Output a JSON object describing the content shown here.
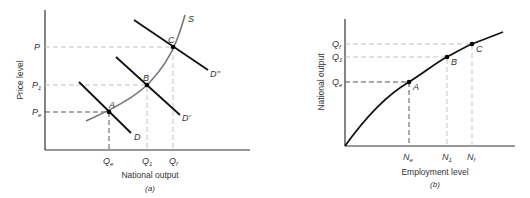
{
  "panel_a": {
    "caption": "(a)",
    "x_axis_label": "National output",
    "y_axis_label": "Price level",
    "curves": {
      "supply": "S",
      "demand": "D",
      "demand_prime": "D'",
      "demand_double_prime": "D''"
    },
    "points": [
      "A",
      "B",
      "C"
    ],
    "x_ticks": [
      "Qe",
      "Q1",
      "Qf"
    ],
    "y_ticks": [
      "P",
      "P1",
      "Pe"
    ]
  },
  "panel_b": {
    "caption": "(b)",
    "x_axis_label": "Employment level",
    "y_axis_label": "National output",
    "points": [
      "A",
      "B",
      "C"
    ],
    "x_ticks": [
      "Ne",
      "N1",
      "Nf"
    ],
    "y_ticks": [
      "Qf",
      "Q1",
      "Qe"
    ]
  }
}
